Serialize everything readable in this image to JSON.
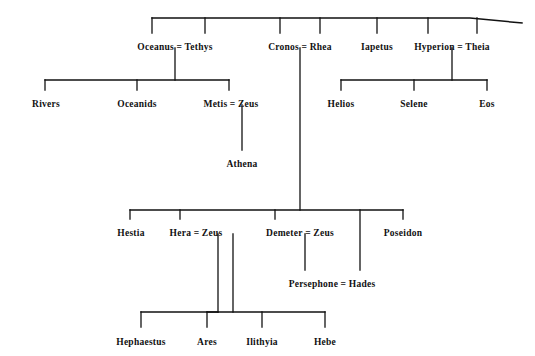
{
  "figure": {
    "kind": "genealogy-tree",
    "background_color": "#ffffff",
    "line_color": "#111111",
    "text_color": "#111111"
  },
  "nodes": [
    {
      "id": "oceanus_tethys",
      "label": "Oceanus = Tethys",
      "left": "Oceanus",
      "right": "Tethys",
      "x": 175,
      "y": 42,
      "generation": 1
    },
    {
      "id": "cronos_rhea",
      "label": "Cronos = Rhea",
      "left": "Cronos",
      "right": "Rhea",
      "x": 300,
      "y": 42,
      "generation": 1
    },
    {
      "id": "iapetus",
      "label": "Iapetus",
      "left": "Iapetus",
      "right": "",
      "x": 377,
      "y": 42,
      "generation": 1
    },
    {
      "id": "hyperion_theia",
      "label": "Hyperion = Theia",
      "left": "Hyperion",
      "right": "Theia",
      "x": 452,
      "y": 42,
      "generation": 1
    },
    {
      "id": "rivers",
      "label": "Rivers",
      "left": "Rivers",
      "right": "",
      "x": 46,
      "y": 99,
      "generation": 2
    },
    {
      "id": "oceanids",
      "label": "Oceanids",
      "left": "Oceanids",
      "right": "",
      "x": 137,
      "y": 99,
      "generation": 2
    },
    {
      "id": "metis_zeus",
      "label": "Metis = Zeus",
      "left": "Metis",
      "right": "Zeus",
      "x": 231,
      "y": 99,
      "generation": 2
    },
    {
      "id": "helios",
      "label": "Helios",
      "left": "Helios",
      "right": "",
      "x": 341,
      "y": 99,
      "generation": 2
    },
    {
      "id": "selene",
      "label": "Selene",
      "left": "Selene",
      "right": "",
      "x": 414,
      "y": 99,
      "generation": 2
    },
    {
      "id": "eos",
      "label": "Eos",
      "left": "Eos",
      "right": "",
      "x": 487,
      "y": 99,
      "generation": 2
    },
    {
      "id": "athena",
      "label": "Athena",
      "left": "Athena",
      "right": "",
      "x": 242,
      "y": 159,
      "generation": 3
    },
    {
      "id": "hestia",
      "label": "Hestia",
      "left": "Hestia",
      "right": "",
      "x": 131,
      "y": 228,
      "generation": 3
    },
    {
      "id": "hera_zeus",
      "label": "Hera = Zeus",
      "left": "Hera",
      "right": "Zeus",
      "x": 196,
      "y": 228,
      "generation": 3
    },
    {
      "id": "demeter_zeus",
      "label": "Demeter = Zeus",
      "left": "Demeter",
      "right": "Zeus",
      "x": 300,
      "y": 228,
      "generation": 3
    },
    {
      "id": "poseidon",
      "label": "Poseidon",
      "left": "Poseidon",
      "right": "",
      "x": 403,
      "y": 228,
      "generation": 3
    },
    {
      "id": "persephone_hades",
      "label": "Persephone = Hades",
      "left": "Persephone",
      "right": "Hades",
      "x": 332,
      "y": 279,
      "generation": 4
    },
    {
      "id": "hephaestus",
      "label": "Hephaestus",
      "left": "Hephaestus",
      "right": "",
      "x": 141,
      "y": 337,
      "generation": 4
    },
    {
      "id": "ares",
      "label": "Ares",
      "left": "Ares",
      "right": "",
      "x": 207,
      "y": 337,
      "generation": 4
    },
    {
      "id": "ilithyia",
      "label": "Ilithyia",
      "left": "Ilithyia",
      "right": "",
      "x": 262,
      "y": 337,
      "generation": 4
    },
    {
      "id": "hebe",
      "label": "Hebe",
      "left": "Hebe",
      "right": "",
      "x": 325,
      "y": 337,
      "generation": 4
    }
  ],
  "unions": [
    {
      "id": "u-oceanus-tethys",
      "partners": [
        "Oceanus",
        "Tethys"
      ],
      "children": [
        "Rivers",
        "Oceanids",
        "Metis"
      ]
    },
    {
      "id": "u-cronos-rhea",
      "partners": [
        "Cronos",
        "Rhea"
      ],
      "children": [
        "Hestia",
        "Hera",
        "Demeter",
        "Hades",
        "Poseidon"
      ]
    },
    {
      "id": "u-hyperion-theia",
      "partners": [
        "Hyperion",
        "Theia"
      ],
      "children": [
        "Helios",
        "Selene",
        "Eos"
      ]
    },
    {
      "id": "u-metis-zeus",
      "partners": [
        "Metis",
        "Zeus"
      ],
      "children": [
        "Athena"
      ]
    },
    {
      "id": "u-hera-zeus",
      "partners": [
        "Hera",
        "Zeus"
      ],
      "children": [
        "Hephaestus",
        "Ares",
        "Ilithyia",
        "Hebe"
      ]
    },
    {
      "id": "u-demeter-zeus",
      "partners": [
        "Demeter",
        "Zeus"
      ],
      "children": [
        "Persephone"
      ]
    },
    {
      "id": "u-persephone-hades",
      "partners": [
        "Persephone",
        "Hades"
      ],
      "children": []
    }
  ],
  "symbols": {
    "marriage": "=",
    "marriage_meaning": "union / marriage between the two names it joins"
  }
}
